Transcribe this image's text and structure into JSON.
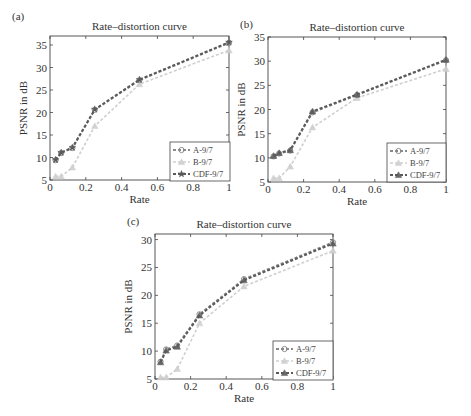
{
  "chart_data": [
    {
      "type": "line",
      "panel": "(a)",
      "title": "Rate–distortion curve",
      "xlabel": "Rate",
      "ylabel": "PSNR in dB",
      "xlim": [
        0,
        1
      ],
      "ylim": [
        5,
        37
      ],
      "xticks": [
        "0",
        "0.2",
        "0.4",
        "0.6",
        "0.8",
        "1"
      ],
      "xtick_values": [
        0,
        0.2,
        0.4,
        0.6,
        0.8,
        1
      ],
      "yticks": [
        "5",
        "10",
        "15",
        "20",
        "25",
        "30",
        "35"
      ],
      "ytick_values": [
        5,
        10,
        15,
        20,
        25,
        30,
        35
      ],
      "legend_position": "bottom-right",
      "x": [
        0.03125,
        0.0625,
        0.125,
        0.25,
        0.5,
        1
      ],
      "series": [
        {
          "name": "A-9/7",
          "values": [
            9.4,
            11.0,
            12.1,
            20.6,
            27.2,
            35.5
          ],
          "color": "#8a8a8a",
          "marker": "circle"
        },
        {
          "name": "B-9/7",
          "values": [
            5.8,
            5.8,
            7.8,
            17.0,
            26.3,
            33.8
          ],
          "color": "#cfcfcf",
          "marker": "triangle"
        },
        {
          "name": "CDF-9/7",
          "values": [
            9.5,
            11.1,
            12.2,
            20.7,
            27.3,
            35.6
          ],
          "color": "#5a5a5a",
          "marker": "star"
        }
      ]
    },
    {
      "type": "line",
      "panel": "(b)",
      "title": "Rate–distortion curve",
      "xlabel": "Rate",
      "ylabel": "PSNR in dB",
      "xlim": [
        0,
        1
      ],
      "ylim": [
        5,
        35
      ],
      "xticks": [
        "0",
        "0.2",
        "0.4",
        "0.6",
        "0.8",
        "1"
      ],
      "xtick_values": [
        0,
        0.2,
        0.4,
        0.6,
        0.8,
        1
      ],
      "yticks": [
        "5",
        "10",
        "15",
        "20",
        "25",
        "30",
        "35"
      ],
      "ytick_values": [
        5,
        10,
        15,
        20,
        25,
        30,
        35
      ],
      "legend_position": "bottom-right",
      "x": [
        0.03125,
        0.0625,
        0.125,
        0.25,
        0.5,
        1
      ],
      "series": [
        {
          "name": "A-9/7",
          "values": [
            10.3,
            10.9,
            11.5,
            19.4,
            23.0,
            30.2
          ],
          "color": "#8a8a8a",
          "marker": "circle"
        },
        {
          "name": "B-9/7",
          "values": [
            5.8,
            5.8,
            8.2,
            16.3,
            22.4,
            28.4
          ],
          "color": "#cfcfcf",
          "marker": "triangle"
        },
        {
          "name": "CDF-9/7",
          "values": [
            10.4,
            11.0,
            11.6,
            19.6,
            23.1,
            30.3
          ],
          "color": "#5a5a5a",
          "marker": "triangle"
        }
      ]
    },
    {
      "type": "line",
      "panel": "(c)",
      "title": "Rate–distortion curve",
      "xlabel": "Rate",
      "ylabel": "PSNR in dB",
      "xlim": [
        0,
        1
      ],
      "ylim": [
        5,
        31
      ],
      "xticks": [
        "0",
        "0.2",
        "0.4",
        "0.6",
        "0.8",
        "1"
      ],
      "xtick_values": [
        0,
        0.2,
        0.4,
        0.6,
        0.8,
        1
      ],
      "yticks": [
        "5",
        "10",
        "15",
        "20",
        "25",
        "30"
      ],
      "ytick_values": [
        5,
        10,
        15,
        20,
        25,
        30
      ],
      "legend_position": "bottom-right",
      "x": [
        0.03125,
        0.0625,
        0.125,
        0.25,
        0.5,
        1
      ],
      "series": [
        {
          "name": "A-9/7",
          "values": [
            8.1,
            10.3,
            11.0,
            16.6,
            22.9,
            29.5
          ],
          "color": "#8a8a8a",
          "marker": "circle"
        },
        {
          "name": "B-9/7",
          "values": [
            5.3,
            5.3,
            6.8,
            15.0,
            21.6,
            28.0
          ],
          "color": "#cfcfcf",
          "marker": "triangle"
        },
        {
          "name": "CDF-9/7",
          "values": [
            8.0,
            10.1,
            10.8,
            16.4,
            22.7,
            29.3
          ],
          "color": "#5a5a5a",
          "marker": "triangle"
        }
      ]
    }
  ]
}
